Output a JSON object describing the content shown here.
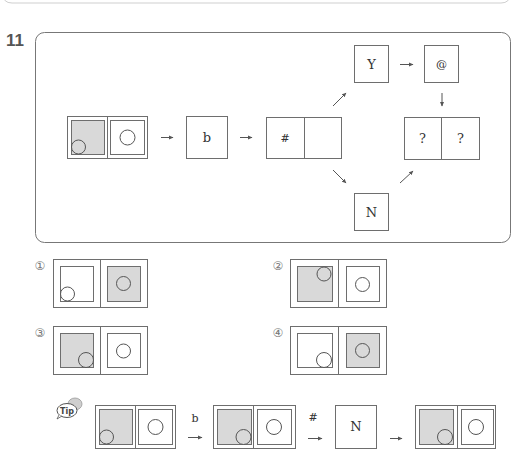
{
  "question": {
    "number": "11"
  },
  "diagram": {
    "start_figure": {
      "left": {
        "shaded": true,
        "circle": "bottom-left"
      },
      "right": {
        "shaded": false,
        "circle": "center"
      }
    },
    "step_b": {
      "label": "b"
    },
    "step_hash": {
      "label": "#",
      "right_label": ""
    },
    "branch_yes": {
      "label": "Y"
    },
    "step_at": {
      "label": "@"
    },
    "branch_no": {
      "label": "N"
    },
    "result": {
      "left": "?",
      "right": "?"
    }
  },
  "options": [
    {
      "marker": "①",
      "left": {
        "shaded": false,
        "circle": "bottom-left"
      },
      "right": {
        "shaded": true,
        "circle": "center"
      }
    },
    {
      "marker": "②",
      "left": {
        "shaded": true,
        "circle": "top-right"
      },
      "right": {
        "shaded": false,
        "circle": "center"
      }
    },
    {
      "marker": "③",
      "left": {
        "shaded": true,
        "circle": "bottom-right"
      },
      "right": {
        "shaded": false,
        "circle": "center"
      }
    },
    {
      "marker": "④",
      "left": {
        "shaded": false,
        "circle": "bottom-right"
      },
      "right": {
        "shaded": true,
        "circle": "center"
      }
    }
  ],
  "tip": {
    "icon_label": "Tip",
    "step1_label": "b",
    "step2_label": "#",
    "step3_label": "N"
  },
  "colors": {
    "shade": "#d9d9d9",
    "stroke": "#6e6e6e",
    "text": "#333333"
  }
}
